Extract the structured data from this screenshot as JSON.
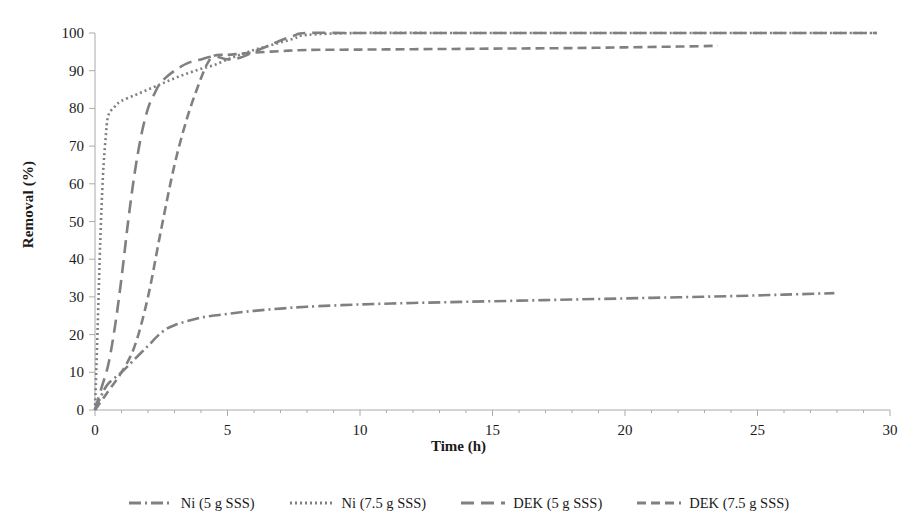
{
  "chart_data": {
    "type": "line",
    "title": "",
    "xlabel": "Time (h)",
    "ylabel": "Removal (%)",
    "xlim": [
      0,
      30
    ],
    "ylim": [
      0,
      100
    ],
    "xticks": [
      0,
      5,
      10,
      15,
      20,
      25,
      30
    ],
    "yticks": [
      0,
      10,
      20,
      30,
      40,
      50,
      60,
      70,
      80,
      90,
      100
    ],
    "grid": false,
    "legend_position": "bottom",
    "line_color": "#808080",
    "series": [
      {
        "name": "Ni (5 g SSS)",
        "dash": "dash-dot",
        "dasharray": "12,4,2,4",
        "x": [
          0,
          0.25,
          0.5,
          1,
          1.5,
          2,
          2.5,
          3,
          4,
          5,
          6,
          7,
          8,
          10,
          12,
          14,
          16,
          18,
          20,
          22,
          24,
          26,
          27.9
        ],
        "y": [
          0,
          4,
          7,
          10,
          13.5,
          17,
          20.5,
          22.5,
          24.5,
          25.5,
          26.3,
          26.9,
          27.4,
          28.0,
          28.4,
          28.7,
          29.0,
          29.3,
          29.6,
          29.9,
          30.2,
          30.6,
          31.0
        ]
      },
      {
        "name": "Ni (7.5 g SSS)",
        "dash": "dotted",
        "dasharray": "2,3",
        "x": [
          0,
          0.1,
          0.2,
          0.3,
          0.4,
          0.5,
          0.75,
          1,
          1.5,
          2,
          2.5,
          3,
          3.5,
          4,
          4.5,
          5,
          5.5,
          6,
          6.5,
          7,
          7.5,
          8,
          10,
          14,
          18,
          22,
          26,
          29.5
        ],
        "y": [
          0,
          22,
          45,
          62,
          72,
          78,
          80.5,
          82,
          83.5,
          85,
          86.5,
          88,
          89.3,
          90.5,
          91.5,
          93,
          94.3,
          95.5,
          96.5,
          97.5,
          98.5,
          99.5,
          100,
          100,
          100,
          100,
          100,
          100
        ]
      },
      {
        "name": "DEK (5 g SSS)",
        "dash": "long-dash",
        "dasharray": "13,7",
        "x": [
          0,
          0.25,
          0.5,
          0.75,
          1,
          1.25,
          1.5,
          1.75,
          2,
          2.25,
          2.5,
          3,
          3.5,
          4,
          4.5,
          5,
          5.5,
          6,
          6.5,
          7,
          7.5,
          8,
          10,
          14,
          18,
          22,
          26,
          29.5
        ],
        "y": [
          0,
          6,
          12,
          22,
          35,
          50,
          63,
          73,
          80,
          84,
          87,
          90,
          92,
          93,
          93.8,
          93,
          93.5,
          95,
          96.5,
          98,
          99.3,
          100,
          100,
          100,
          100,
          100,
          100,
          100
        ]
      },
      {
        "name": "DEK (7.5 g SSS)",
        "dash": "dash",
        "dasharray": "9,5",
        "x": [
          0,
          0.5,
          1,
          1.5,
          2,
          2.5,
          3,
          3.5,
          4,
          4.25,
          4.5,
          5,
          5.5,
          6,
          7,
          8,
          10,
          12,
          14,
          16,
          18,
          20,
          22,
          23.5
        ],
        "y": [
          0,
          5,
          10,
          17,
          30,
          48,
          65,
          78,
          88,
          92,
          94,
          94.2,
          94.5,
          94.8,
          95.2,
          95.5,
          95.6,
          95.7,
          95.8,
          95.9,
          96.0,
          96.2,
          96.4,
          96.6
        ]
      }
    ]
  },
  "axis": {
    "x_tick_labels": [
      "0",
      "5",
      "10",
      "15",
      "20",
      "25",
      "30"
    ],
    "y_tick_labels": [
      "0",
      "10",
      "20",
      "30",
      "40",
      "50",
      "60",
      "70",
      "80",
      "90",
      "100"
    ],
    "x_title": "Time (h)",
    "y_title": "Removal (%)"
  },
  "legend": {
    "items": [
      {
        "label": "Ni (5 g SSS)"
      },
      {
        "label": "Ni (7.5 g SSS)"
      },
      {
        "label": "DEK (5 g SSS)"
      },
      {
        "label": "DEK (7.5 g SSS)"
      }
    ]
  }
}
